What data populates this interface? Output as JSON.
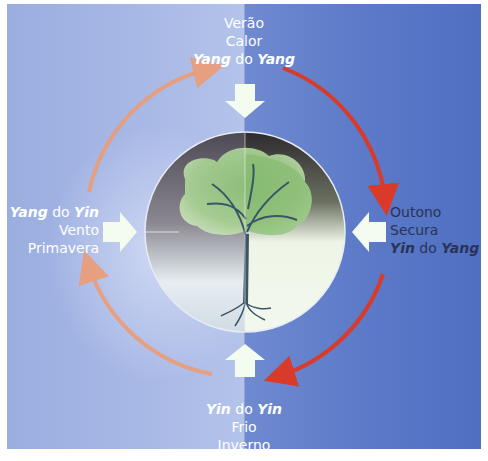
{
  "diagram": {
    "center_image": "tree-illustration",
    "colors": {
      "background_left": "#a9b9e6",
      "background_right": "#5c7ac8",
      "cycle_arrow_yang": "#f09a6e",
      "cycle_arrow_yin": "#d93a2a",
      "block_arrow": "#f4fbef",
      "text_light": "#ffffff",
      "text_dark": "#2a3356"
    },
    "seasons": {
      "top": {
        "season": "Verão",
        "climate": "Calor",
        "aspect_a": "Yang",
        "connector": " do ",
        "aspect_b": "Yang"
      },
      "right": {
        "season": "Outono",
        "climate": "Secura",
        "aspect_a": "Yin",
        "connector": " do ",
        "aspect_b": "Yang"
      },
      "bottom": {
        "season": "Inverno",
        "climate": "Frio",
        "aspect_a": "Yin",
        "connector": " do ",
        "aspect_b": "Yin"
      },
      "left": {
        "season": "Primavera",
        "climate": "Vento",
        "aspect_a": "Yang",
        "connector": " do ",
        "aspect_b": "Yin"
      }
    }
  }
}
